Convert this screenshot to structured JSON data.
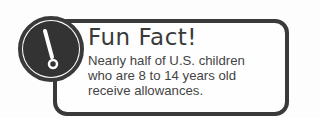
{
  "callout": {
    "icon": "exclamation-icon",
    "title": "Fun Fact!",
    "lines": [
      "Nearly half of U.S. children",
      "who are 8 to 14 years old",
      "receive allowances."
    ]
  },
  "colors": {
    "outline": "#3a3a3a",
    "badge_fill": "#333333",
    "background": "#fefefe"
  }
}
